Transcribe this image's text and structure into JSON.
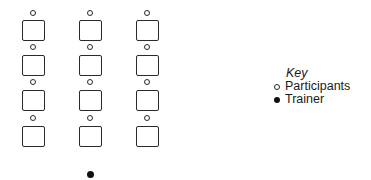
{
  "diagram": {
    "type": "seating-arrangement",
    "columns": 3,
    "rows": 4,
    "column_centers_x": [
      33,
      90,
      147
    ],
    "seat_tops_y": [
      20,
      55,
      90,
      126
    ],
    "participant_y": [
      13,
      47,
      82,
      118
    ],
    "trainer": {
      "x": 90,
      "y": 174
    }
  },
  "legend": {
    "title": "Key",
    "items": [
      {
        "symbol": "open-circle",
        "label": "Participants"
      },
      {
        "symbol": "filled-circle",
        "label": "Trainer"
      }
    ]
  }
}
